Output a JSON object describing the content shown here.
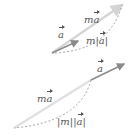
{
  "diagrams": [
    {
      "id": "positive-scalar",
      "labels": {
        "a": "a",
        "ma_m": "m",
        "ma_a": "a",
        "norm_m": "m|",
        "norm_a": "a",
        "norm_close": "|"
      }
    },
    {
      "id": "negative-scalar",
      "labels": {
        "a": "a",
        "ma_m": "m",
        "ma_a": "a",
        "norm_open": "|m||",
        "norm_a": "a",
        "norm_close": "|"
      }
    }
  ],
  "colors": {
    "vector_a": "#8a8a8a",
    "vector_ma": "#d4d4d4",
    "dashed": "#9a9a9a",
    "text": "#555555"
  }
}
